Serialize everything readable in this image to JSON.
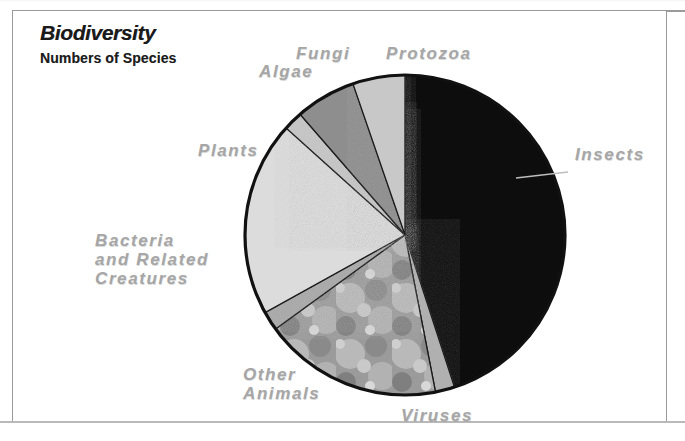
{
  "figure": {
    "title": "Biodiversity",
    "subtitle": "Numbers of Species",
    "label_color": "#a6a6a6",
    "frame_color": "#9a9a9a",
    "background": "#ffffff"
  },
  "chart_data": {
    "type": "pie",
    "title": "Biodiversity",
    "subtitle": "Numbers of Species",
    "xlabel": "",
    "ylabel": "",
    "legend_position": "around-slices",
    "grid": false,
    "units": "percent of total known species",
    "categories": [
      "Insects",
      "Viruses",
      "Other Animals",
      "Bacteria and Related Creatures",
      "Plants",
      "Algae",
      "Fungi",
      "Protozoa"
    ],
    "values": [
      45,
      2,
      18,
      2,
      20,
      2,
      6,
      5
    ],
    "slices": [
      {
        "label": "Insects",
        "value": 45,
        "start_deg": 0,
        "end_deg": 162,
        "color": "#0d0d0d",
        "texture": "solid"
      },
      {
        "label": "Viruses",
        "value": 2,
        "start_deg": 162,
        "end_deg": 169,
        "color": "#b0b0b0",
        "texture": "solid"
      },
      {
        "label": "Other Animals",
        "value": 18,
        "start_deg": 169,
        "end_deg": 234,
        "color": "#9d9d9d",
        "texture": "photo"
      },
      {
        "label": "Bacteria and Related Creatures",
        "value": 2,
        "start_deg": 234,
        "end_deg": 241,
        "color": "#a9a9a9",
        "texture": "solid"
      },
      {
        "label": "Plants",
        "value": 20,
        "start_deg": 241,
        "end_deg": 312,
        "color": "#dcdcdc",
        "texture": "solid"
      },
      {
        "label": "Algae",
        "value": 2,
        "start_deg": 312,
        "end_deg": 319,
        "color": "#c6c6c6",
        "texture": "solid"
      },
      {
        "label": "Fungi",
        "value": 6,
        "start_deg": 319,
        "end_deg": 341,
        "color": "#8e8e8e",
        "texture": "solid"
      },
      {
        "label": "Protozoa",
        "value": 5,
        "start_deg": 341,
        "end_deg": 360,
        "color": "#c8c8c8",
        "texture": "solid"
      }
    ]
  },
  "labels": {
    "fungi": "Fungi",
    "protozoa": "Protozoa",
    "algae": "Algae",
    "insects": "Insects",
    "plants": "Plants",
    "bacteria": "Bacteria\nand Related\nCreatures",
    "other_animals": "Other\nAnimals",
    "viruses": "Viruses"
  }
}
